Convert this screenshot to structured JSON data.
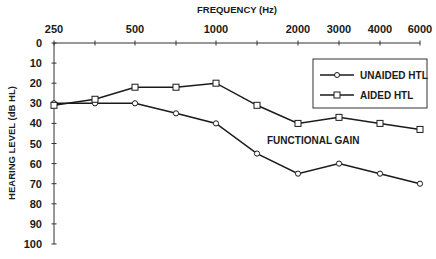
{
  "chart_data": {
    "type": "line",
    "title": "",
    "xlabel": "FREQUENCY (Hz)",
    "ylabel": "HEARING LEVEL (dB HL)",
    "x_position": "top",
    "y_inverted": true,
    "ylim": [
      0,
      100
    ],
    "x_ticks": [
      250,
      375,
      500,
      750,
      1000,
      1500,
      2000,
      3000,
      4000,
      6000
    ],
    "x_tick_labels": [
      {
        "value": 250,
        "label": "250"
      },
      {
        "value": 500,
        "label": "500"
      },
      {
        "value": 1000,
        "label": "1000"
      },
      {
        "value": 2000,
        "label": "2000"
      },
      {
        "value": 3000,
        "label": "3000"
      },
      {
        "value": 4000,
        "label": "4000"
      },
      {
        "value": 6000,
        "label": "6000"
      }
    ],
    "y_ticks": [
      0,
      10,
      20,
      30,
      40,
      50,
      60,
      70,
      80,
      90,
      100
    ],
    "x": [
      250,
      375,
      500,
      750,
      1000,
      1500,
      2000,
      3000,
      4000,
      6000
    ],
    "series": [
      {
        "name": "UNAIDED HTL",
        "marker": "circle",
        "values": [
          30,
          30,
          30,
          35,
          40,
          55,
          65,
          60,
          65,
          70
        ]
      },
      {
        "name": "AIDED HTL",
        "marker": "square",
        "values": [
          31,
          28,
          22,
          22,
          20,
          31,
          40,
          37,
          40,
          43
        ]
      }
    ],
    "legend": {
      "position": "upper right",
      "entries": [
        "UNAIDED HTL",
        "AIDED HTL"
      ]
    },
    "annotations": [
      {
        "text": "FUNCTIONAL GAIN",
        "x": 2000,
        "y": 52
      }
    ],
    "grid": false,
    "colors": {
      "line": "#1a1a1a",
      "background": "#ffffff",
      "marker_fill": "#ffffff"
    }
  }
}
